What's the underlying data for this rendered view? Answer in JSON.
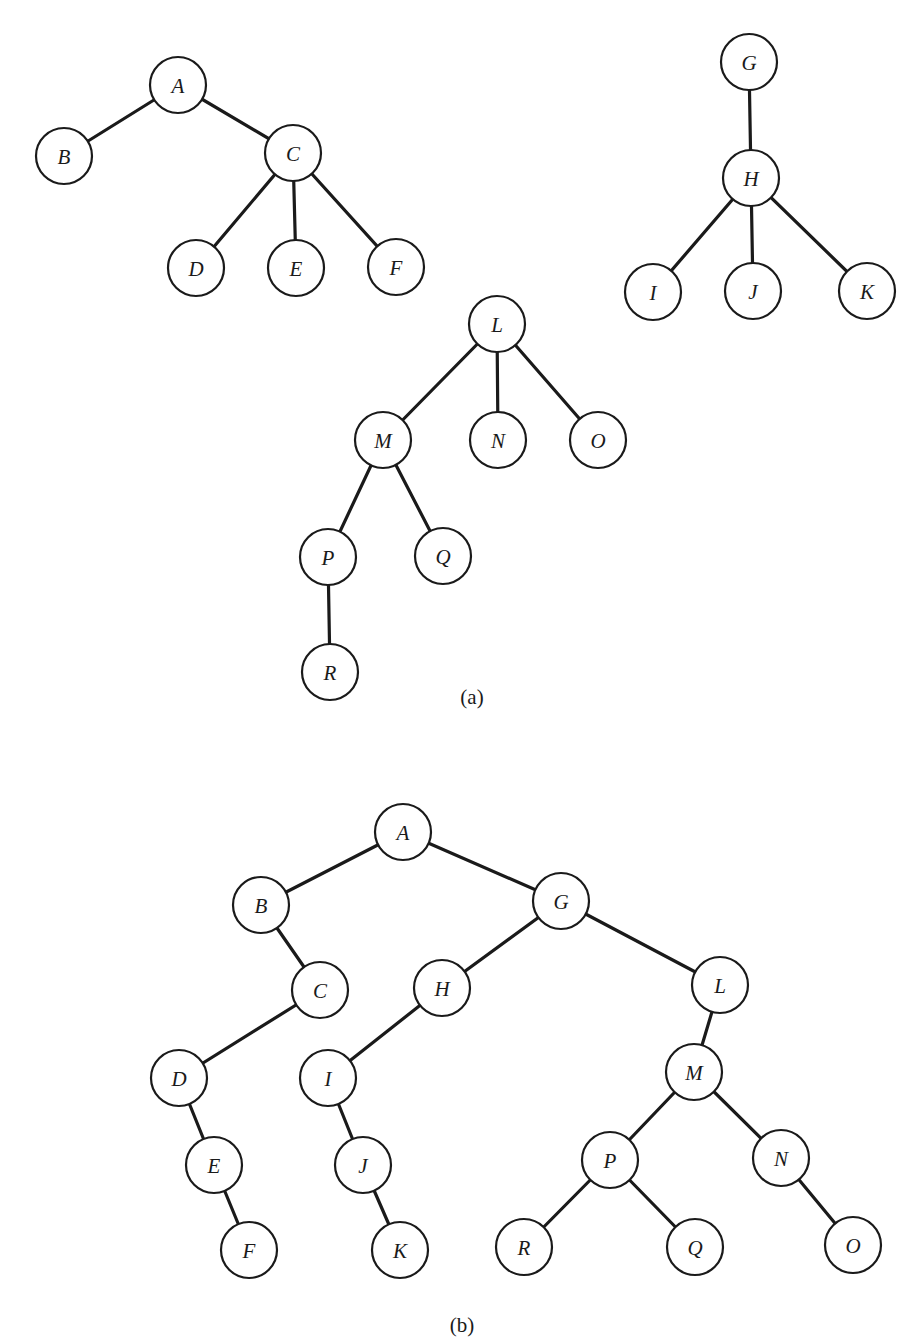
{
  "figure": {
    "node_radius": 28,
    "colors": {
      "stroke": "#1a1a1a",
      "fill": "#ffffff",
      "background": "#ffffff"
    },
    "panels": [
      {
        "id": "a",
        "caption": "(a)",
        "caption_pos": [
          472,
          697
        ],
        "description": "Forest of three general trees",
        "nodes": [
          {
            "id": "a-A",
            "label": "A",
            "x": 178,
            "y": 85
          },
          {
            "id": "a-B",
            "label": "B",
            "x": 64,
            "y": 156
          },
          {
            "id": "a-C",
            "label": "C",
            "x": 293,
            "y": 153
          },
          {
            "id": "a-D",
            "label": "D",
            "x": 196,
            "y": 268
          },
          {
            "id": "a-E",
            "label": "E",
            "x": 296,
            "y": 268
          },
          {
            "id": "a-F",
            "label": "F",
            "x": 396,
            "y": 267
          },
          {
            "id": "a-G",
            "label": "G",
            "x": 749,
            "y": 62
          },
          {
            "id": "a-H",
            "label": "H",
            "x": 751,
            "y": 178
          },
          {
            "id": "a-I",
            "label": "I",
            "x": 653,
            "y": 292
          },
          {
            "id": "a-J",
            "label": "J",
            "x": 753,
            "y": 291
          },
          {
            "id": "a-K",
            "label": "K",
            "x": 867,
            "y": 291
          },
          {
            "id": "a-L",
            "label": "L",
            "x": 497,
            "y": 324
          },
          {
            "id": "a-M",
            "label": "M",
            "x": 383,
            "y": 440
          },
          {
            "id": "a-N",
            "label": "N",
            "x": 498,
            "y": 440
          },
          {
            "id": "a-O",
            "label": "O",
            "x": 598,
            "y": 440
          },
          {
            "id": "a-P",
            "label": "P",
            "x": 328,
            "y": 557
          },
          {
            "id": "a-Q",
            "label": "Q",
            "x": 443,
            "y": 556
          },
          {
            "id": "a-R",
            "label": "R",
            "x": 330,
            "y": 672
          }
        ],
        "edges": [
          [
            "a-A",
            "a-B"
          ],
          [
            "a-A",
            "a-C"
          ],
          [
            "a-C",
            "a-D"
          ],
          [
            "a-C",
            "a-E"
          ],
          [
            "a-C",
            "a-F"
          ],
          [
            "a-G",
            "a-H"
          ],
          [
            "a-H",
            "a-I"
          ],
          [
            "a-H",
            "a-J"
          ],
          [
            "a-H",
            "a-K"
          ],
          [
            "a-L",
            "a-M"
          ],
          [
            "a-L",
            "a-N"
          ],
          [
            "a-L",
            "a-O"
          ],
          [
            "a-M",
            "a-P"
          ],
          [
            "a-M",
            "a-Q"
          ],
          [
            "a-P",
            "a-R"
          ]
        ]
      },
      {
        "id": "b",
        "caption": "(b)",
        "caption_pos": [
          462,
          1325
        ],
        "description": "Binary tree representation of the forest",
        "nodes": [
          {
            "id": "b-A",
            "label": "A",
            "x": 403,
            "y": 832
          },
          {
            "id": "b-B",
            "label": "B",
            "x": 261,
            "y": 905
          },
          {
            "id": "b-G",
            "label": "G",
            "x": 561,
            "y": 901
          },
          {
            "id": "b-C",
            "label": "C",
            "x": 320,
            "y": 990
          },
          {
            "id": "b-H",
            "label": "H",
            "x": 442,
            "y": 988
          },
          {
            "id": "b-L",
            "label": "L",
            "x": 720,
            "y": 985
          },
          {
            "id": "b-D",
            "label": "D",
            "x": 179,
            "y": 1078
          },
          {
            "id": "b-I",
            "label": "I",
            "x": 328,
            "y": 1078
          },
          {
            "id": "b-M",
            "label": "M",
            "x": 694,
            "y": 1072
          },
          {
            "id": "b-E",
            "label": "E",
            "x": 214,
            "y": 1165
          },
          {
            "id": "b-J",
            "label": "J",
            "x": 363,
            "y": 1165
          },
          {
            "id": "b-P",
            "label": "P",
            "x": 610,
            "y": 1160
          },
          {
            "id": "b-N",
            "label": "N",
            "x": 781,
            "y": 1158
          },
          {
            "id": "b-F",
            "label": "F",
            "x": 249,
            "y": 1250
          },
          {
            "id": "b-K",
            "label": "K",
            "x": 400,
            "y": 1250
          },
          {
            "id": "b-R",
            "label": "R",
            "x": 524,
            "y": 1247
          },
          {
            "id": "b-Q",
            "label": "Q",
            "x": 695,
            "y": 1247
          },
          {
            "id": "b-O",
            "label": "O",
            "x": 853,
            "y": 1245
          }
        ],
        "edges": [
          [
            "b-A",
            "b-B"
          ],
          [
            "b-A",
            "b-G"
          ],
          [
            "b-B",
            "b-C"
          ],
          [
            "b-C",
            "b-D"
          ],
          [
            "b-D",
            "b-E"
          ],
          [
            "b-E",
            "b-F"
          ],
          [
            "b-G",
            "b-H"
          ],
          [
            "b-G",
            "b-L"
          ],
          [
            "b-H",
            "b-I"
          ],
          [
            "b-I",
            "b-J"
          ],
          [
            "b-J",
            "b-K"
          ],
          [
            "b-L",
            "b-M"
          ],
          [
            "b-M",
            "b-P"
          ],
          [
            "b-M",
            "b-N"
          ],
          [
            "b-P",
            "b-R"
          ],
          [
            "b-P",
            "b-Q"
          ],
          [
            "b-N",
            "b-O"
          ]
        ]
      }
    ]
  }
}
